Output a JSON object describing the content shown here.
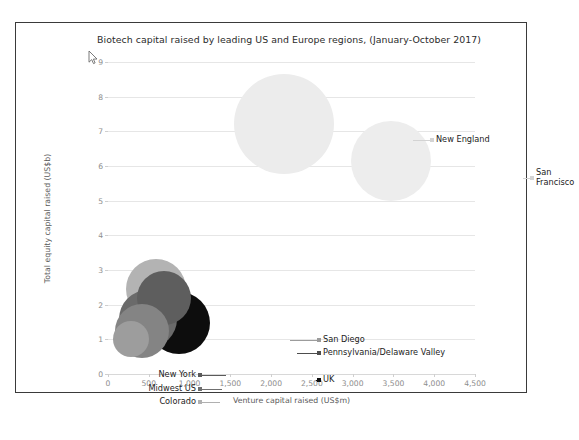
{
  "chart_data": {
    "type": "scatter",
    "title": "Biotech capital raised by leading US and Europe regions, (January-October 2017)",
    "xlabel": "Venture capital raised (US$m)",
    "ylabel": "Total equity capital raised (US$b)",
    "xlim": [
      0,
      4500
    ],
    "ylim": [
      0,
      9
    ],
    "xticks": [
      "0",
      "500",
      "1,000",
      "1,500",
      "2,000",
      "2,500",
      "3,000",
      "3,500",
      "4,000",
      "4,500"
    ],
    "xtick_values": [
      0,
      500,
      1000,
      1500,
      2000,
      2500,
      3000,
      3500,
      4000,
      4500
    ],
    "yticks": [
      "0",
      "1",
      "2",
      "3",
      "4",
      "5",
      "6",
      "7",
      "8",
      "9"
    ],
    "ytick_values": [
      0,
      1,
      2,
      3,
      4,
      5,
      6,
      7,
      8,
      9
    ],
    "grid": true,
    "legend": "none",
    "bubbles": [
      {
        "label": "New England",
        "x": 2160,
        "y": 7.2,
        "r_px": 50,
        "color": "#ececec",
        "label_side": "right",
        "label_x_px": 328,
        "label_y_px": 78,
        "leader_from_px": 305,
        "marker_color": "#d3d3d3"
      },
      {
        "label": "San Francisco",
        "x": 3470,
        "y": 6.15,
        "r_px": 40,
        "color": "#ededed",
        "label_side": "two-line",
        "label_x_px": 428,
        "label_y_px": 116,
        "leader_from_px": 415,
        "marker_color": "#d3d3d3"
      },
      {
        "label": "San Diego",
        "x": 590,
        "y": 2.45,
        "r_px": 30,
        "color": "#b3b3b3",
        "label_side": "right",
        "label_x_px": 215,
        "label_y_px": 278,
        "leader_from_px": 182,
        "marker_color": "#9c9c9c"
      },
      {
        "label": "Pennsylvania/Delaware Valley",
        "x": 690,
        "y": 2.2,
        "r_px": 27,
        "color": "#5e5e5e",
        "label_side": "right",
        "label_x_px": 215,
        "label_y_px": 291,
        "leader_from_px": 189,
        "marker_color": "#4d4d4d"
      },
      {
        "label": "UK",
        "x": 870,
        "y": 1.47,
        "r_px": 31,
        "color": "#0d0d0d",
        "label_side": "right",
        "label_x_px": 215,
        "label_y_px": 318,
        "leader_from_px": 208,
        "marker_color": "#111111"
      },
      {
        "label": "New York",
        "x": 490,
        "y": 1.6,
        "r_px": 29,
        "color": "#6a6a6a",
        "label_side": "left",
        "label_x_px": 88,
        "label_y_px": 313,
        "leader_from_px": 118,
        "marker_color": "#5a5a5a"
      },
      {
        "label": "Midwest US",
        "x": 420,
        "y": 1.25,
        "r_px": 27,
        "color": "#848484",
        "label_side": "left",
        "label_x_px": 88,
        "label_y_px": 327,
        "leader_from_px": 114,
        "marker_color": "#6f6f6f"
      },
      {
        "label": "Colorado",
        "x": 280,
        "y": 1.0,
        "r_px": 18,
        "color": "#9d9d9d",
        "label_side": "left",
        "label_x_px": 88,
        "label_y_px": 340,
        "leader_from_px": 112,
        "marker_color": "#b0b0b0"
      }
    ]
  },
  "cursor": {
    "name": "mouse-pointer"
  }
}
